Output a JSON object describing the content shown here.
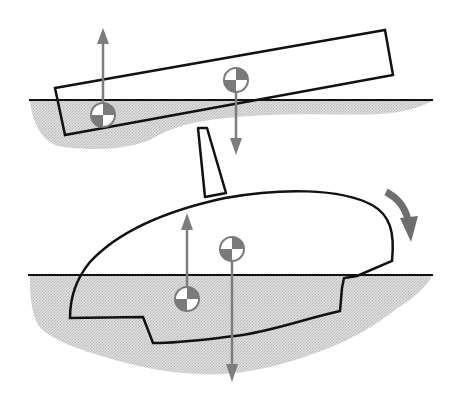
{
  "figure": {
    "description": "Stability diagram: tilted plank and heeling sailboat hull showing center of gravity and center of buoyancy force arrows",
    "colors": {
      "background": "#ffffff",
      "outline": "#111111",
      "water": "#d4d4d4",
      "force_arrow": "#7d7d7d",
      "cg_symbol_fill": "#7a7a7a",
      "heel_arrow": "#6e6e6e"
    },
    "panels": [
      {
        "name": "plank",
        "waterline_y": 100,
        "symbols": [
          {
            "role": "center-of-buoyancy",
            "x": 103,
            "y": 115,
            "arrow": "up"
          },
          {
            "role": "center-of-gravity",
            "x": 236,
            "y": 80,
            "arrow": "down"
          }
        ]
      },
      {
        "name": "sailboat-hull",
        "waterline_y": 275,
        "symbols": [
          {
            "role": "center-of-buoyancy",
            "x": 187,
            "y": 299,
            "arrow": "up"
          },
          {
            "role": "center-of-gravity",
            "x": 232,
            "y": 249,
            "arrow": "down"
          }
        ],
        "rotation_indicator": "clockwise-heel-arrow"
      }
    ]
  }
}
